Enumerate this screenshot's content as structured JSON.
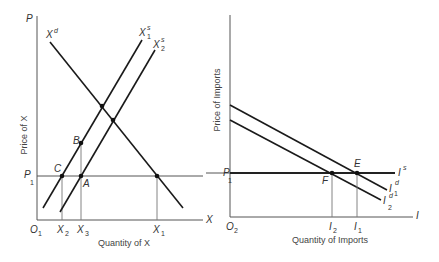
{
  "left_panel": {
    "y_axis_label": "P",
    "x_axis_label": "X",
    "origin_label": "O",
    "origin_sub": "1",
    "y_title": "Price of X",
    "x_title": "Quantity of X",
    "demand_curve": {
      "label": "X",
      "sup": "d"
    },
    "supply_curves": [
      {
        "label": "X",
        "sup": "s",
        "sub": "1"
      },
      {
        "label": "X",
        "sup": "s",
        "sub": "2"
      }
    ],
    "price_line": {
      "label": "P",
      "sub": "1"
    },
    "points": {
      "A": "A",
      "B": "B",
      "C": "C"
    },
    "x_ticks": [
      {
        "label": "X",
        "sub": "2"
      },
      {
        "label": "X",
        "sub": "3"
      },
      {
        "label": "X",
        "sub": "1"
      }
    ]
  },
  "right_panel": {
    "x_axis_label": "I",
    "origin_label": "O",
    "origin_sub": "2",
    "y_title": "Price of Imports",
    "x_title": "Quantity of Imports",
    "price_line": {
      "label": "P",
      "sub": "1"
    },
    "supply_label": {
      "label": "I",
      "sup": "s"
    },
    "demand_curves": [
      {
        "label": "I",
        "sup": "d",
        "sub": "1"
      },
      {
        "label": "I",
        "sup": "d",
        "sub": "2"
      }
    ],
    "points": {
      "E": "E",
      "F": "F"
    },
    "x_ticks": [
      {
        "label": "I",
        "sub": "2"
      },
      {
        "label": "I",
        "sub": "1"
      }
    ]
  }
}
